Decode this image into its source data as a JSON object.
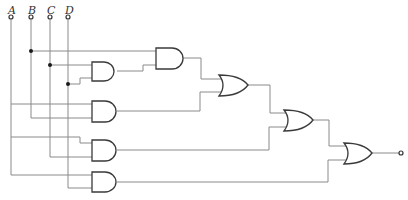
{
  "diagram": {
    "type": "logic-circuit",
    "inputs": [
      {
        "label": "A",
        "x": 11
      },
      {
        "label": "B",
        "x": 31
      },
      {
        "label": "C",
        "x": 50
      },
      {
        "label": "D",
        "x": 68
      }
    ],
    "gates": [
      {
        "id": "and1",
        "type": "AND",
        "inputs": [
          "C",
          "D"
        ]
      },
      {
        "id": "and2",
        "type": "AND",
        "inputs": [
          "B",
          "and1"
        ]
      },
      {
        "id": "and3",
        "type": "AND",
        "inputs": [
          "A",
          "B"
        ]
      },
      {
        "id": "or1",
        "type": "OR",
        "inputs": [
          "and2",
          "and3"
        ]
      },
      {
        "id": "and4",
        "type": "AND",
        "inputs": [
          "A",
          "C"
        ]
      },
      {
        "id": "or2",
        "type": "OR",
        "inputs": [
          "or1",
          "and4"
        ]
      },
      {
        "id": "and5",
        "type": "AND",
        "inputs": [
          "A",
          "D"
        ]
      },
      {
        "id": "or3",
        "type": "OR",
        "inputs": [
          "or2",
          "and5"
        ]
      }
    ],
    "output": {
      "source": "or3",
      "label": ""
    },
    "colors": {
      "wire": "#8a8a8a",
      "gate": "#3a3a3a",
      "background": "#ffffff"
    }
  }
}
